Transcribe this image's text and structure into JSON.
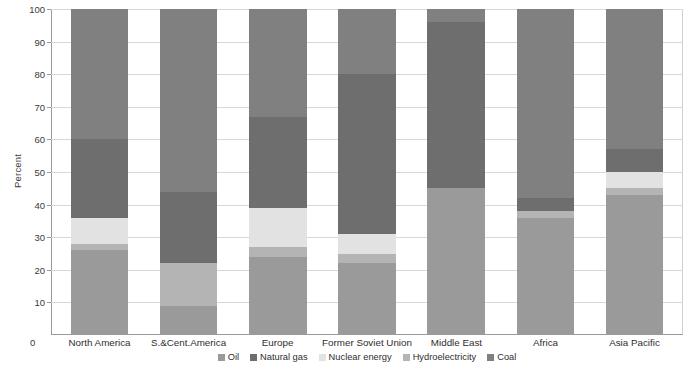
{
  "chart_data": {
    "type": "bar",
    "title": "",
    "subtitle": "",
    "xlabel": "",
    "ylabel": "Percent",
    "ylim": [
      0,
      100
    ],
    "ytick_labels": [
      "0",
      "10",
      "20",
      "30",
      "40",
      "50",
      "60",
      "70",
      "80",
      "90",
      "100"
    ],
    "ytick_values": [
      0,
      10,
      20,
      30,
      40,
      50,
      60,
      70,
      80,
      90,
      100
    ],
    "grid": true,
    "stacked": true,
    "normalized_percent": true,
    "legend_position": "bottom-center",
    "categories": [
      "North America",
      "S.&Cent.America",
      "Europe",
      "Former Soviet Union",
      "Middle East",
      "Africa",
      "Asia Pacific"
    ],
    "series": [
      {
        "name": "Oil",
        "color": "#9a9a9a",
        "values": [
          26,
          9,
          24,
          22,
          45,
          36,
          43
        ]
      },
      {
        "name": "Hydroelectricity",
        "color": "#b4b4b4",
        "values": [
          2,
          13,
          3,
          3,
          0,
          2,
          2
        ]
      },
      {
        "name": "Nuclear energy",
        "color": "#e2e2e2",
        "values": [
          8,
          0,
          12,
          6,
          0,
          0,
          5
        ]
      },
      {
        "name": "Natural gas",
        "color": "#6e6e6e",
        "values": [
          24,
          22,
          28,
          49,
          51,
          4,
          7
        ]
      },
      {
        "name": "Coal",
        "color": "#808080",
        "values": [
          40,
          56,
          33,
          20,
          4,
          58,
          43
        ]
      }
    ],
    "annotations": []
  },
  "legend": {
    "items": [
      {
        "label": "Oil",
        "color": "#9a9a9a"
      },
      {
        "label": "Natural gas",
        "color": "#6e6e6e"
      },
      {
        "label": "Nuclear energy",
        "color": "#e2e2e2"
      },
      {
        "label": "Hydroelectricity",
        "color": "#b4b4b4"
      },
      {
        "label": "Coal",
        "color": "#808080"
      }
    ]
  },
  "axes": {
    "y_title": "Percent",
    "zero_label": "0"
  },
  "colors": {
    "plot_background": "#ffffff",
    "gridline": "#d8d8d8",
    "axis_line": "#9a9a9a",
    "text": "#2e2e2e"
  }
}
